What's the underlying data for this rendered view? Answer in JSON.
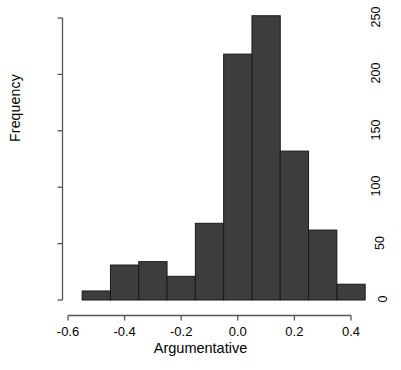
{
  "chart_data": {
    "type": "bar",
    "title": "",
    "subtitle": "",
    "xlabel": "Argumentative",
    "ylabel": "Frequency",
    "grid": false,
    "legend": false,
    "bin_width": 0.1,
    "bin_edges": [
      -0.55,
      -0.45,
      -0.35,
      -0.25,
      -0.15,
      -0.05,
      0.05,
      0.15,
      0.25,
      0.35,
      0.45
    ],
    "categories": [
      "-0.55 to -0.45",
      "-0.45 to -0.35",
      "-0.35 to -0.25",
      "-0.25 to -0.15",
      "-0.15 to -0.05",
      "-0.05 to 0.05",
      "0.05 to 0.15",
      "0.15 to 0.25",
      "0.25 to 0.35",
      "0.35 to 0.45"
    ],
    "bin_centers": [
      -0.5,
      -0.4,
      -0.3,
      -0.2,
      -0.1,
      0.0,
      0.1,
      0.2,
      0.3,
      0.4
    ],
    "values": [
      8,
      31,
      34,
      21,
      68,
      218,
      252,
      132,
      62,
      14
    ],
    "xlim": [
      -0.6,
      0.45
    ],
    "ylim": [
      0,
      252
    ],
    "xticks": [
      -0.6,
      -0.4,
      -0.2,
      0.0,
      0.2,
      0.4
    ],
    "xtick_labels": [
      "-0.6",
      "-0.4",
      "-0.2",
      "0.0",
      "0.2",
      "0.4"
    ],
    "yticks": [
      0,
      50,
      100,
      150,
      200,
      250
    ],
    "ytick_labels": [
      "0",
      "50",
      "100",
      "150",
      "200",
      "250"
    ],
    "bar_color": "#3d3d3d",
    "bar_edge_color": "#1a1a1a",
    "axis_color": "#555555",
    "background_color": "#ffffff"
  }
}
